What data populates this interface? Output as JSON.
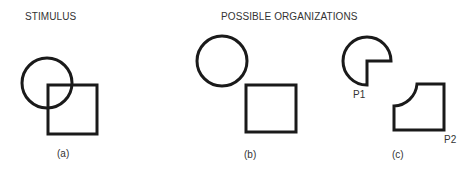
{
  "headings": {
    "stimulus": "STIMULUS",
    "possible_organizations": "POSSIBLE ORGANIZATIONS"
  },
  "panels": [
    {
      "label": "(a)",
      "description": "overlapping circle and square (stimulus)"
    },
    {
      "label": "(b)",
      "description": "separate circle and square"
    },
    {
      "label": "(c)",
      "description": "notched circle and cut-corner square",
      "parts": [
        {
          "label": "P1"
        },
        {
          "label": "P2"
        }
      ]
    }
  ],
  "colors": {
    "stroke": "#1a1a1a",
    "text": "#333333",
    "background": "#ffffff"
  }
}
